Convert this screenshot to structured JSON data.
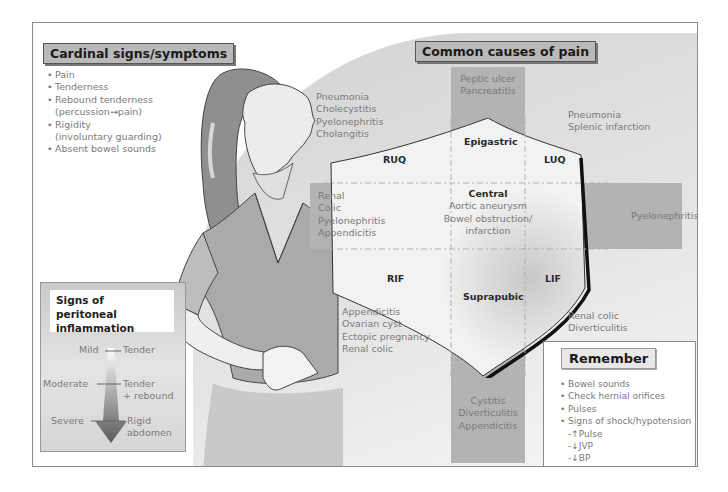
{
  "cardinal": {
    "title": "Cardinal signs/symptoms",
    "items": [
      {
        "text": "Pain",
        "bullet": true
      },
      {
        "text": "Tenderness",
        "bullet": true
      },
      {
        "text": "Rebound tenderness",
        "bullet": true
      },
      {
        "text": "(percussion→pain)",
        "bullet": false
      },
      {
        "text": "Rigidity",
        "bullet": true
      },
      {
        "text": "(involuntary guarding)",
        "bullet": false
      },
      {
        "text": "Absent bowel sounds",
        "bullet": true
      }
    ]
  },
  "causes": {
    "title": "Common causes of pain",
    "epigastric_above": [
      "Peptic ulcer",
      "Pancreatitis"
    ],
    "ruq_outside": [
      "Pneumonia",
      "Cholecystitis",
      "Pyelonephritis",
      "Cholangitis"
    ],
    "luq_outside": [
      "Pneumonia",
      "Splenic infarction"
    ],
    "right_flank": [
      "Renal",
      "Colic",
      "Pyelonephritis",
      "Appendicitis"
    ],
    "left_flank": [
      "Pyelonephritis"
    ],
    "rif_outside": [
      "Appendicitis",
      "Ovarian cyst",
      "Ectopic pregnancy",
      "Renal colic"
    ],
    "lif_outside": [
      "Renal colic",
      "Diverticulitis"
    ],
    "suprapubic_below": [
      "Cystitis",
      "Diverticulitis",
      "Appendicitis"
    ],
    "central": {
      "label": "Central",
      "items": [
        "Aortic aneurysm",
        "Bowel obstruction/",
        "infarction"
      ]
    },
    "regions": {
      "epigastric": "Epigastric",
      "ruq": "RUQ",
      "luq": "LUQ",
      "rif": "RIF",
      "lif": "LIF",
      "suprapubic": "Suprapubic"
    }
  },
  "peritoneal": {
    "title_line1": "Signs of peritoneal",
    "title_line2": "inflammation",
    "levels": [
      {
        "severity": "Mild",
        "sign_line1": "Tender",
        "sign_line2": ""
      },
      {
        "severity": "Moderate",
        "sign_line1": "Tender",
        "sign_line2": "+ rebound"
      },
      {
        "severity": "Severe",
        "sign_line1": "Rigid",
        "sign_line2": "abdomen"
      }
    ]
  },
  "remember": {
    "title": "Remember",
    "items": [
      {
        "text": "Bowel sounds",
        "bullet": true
      },
      {
        "text": "Check hernial orifices",
        "bullet": true
      },
      {
        "text": "Pulses",
        "bullet": true
      },
      {
        "text": "Signs of shock/hypotension",
        "bullet": true
      },
      {
        "text": "-↑Pulse",
        "bullet": false
      },
      {
        "text": "-↓JVP",
        "bullet": false
      },
      {
        "text": "-↓BP",
        "bullet": false
      }
    ]
  },
  "illustration": {
    "subject": "woman-in-abdominal-pain"
  }
}
